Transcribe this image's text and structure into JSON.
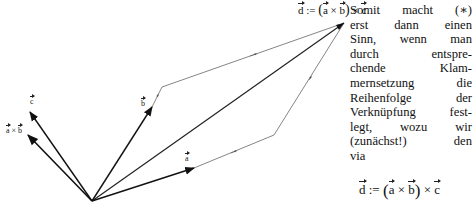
{
  "figure": {
    "origin": [
      92,
      201
    ],
    "vectors": [
      {
        "name": "a",
        "label": "a",
        "tip": [
          194,
          168
        ],
        "end": [
          274,
          135
        ]
      },
      {
        "name": "b",
        "label": "b",
        "tip": [
          152,
          107
        ],
        "end": [
          162,
          87
        ]
      },
      {
        "name": "c",
        "label": "c",
        "tip": [
          30,
          112
        ]
      },
      {
        "name": "a_cross_b",
        "label": "a × b",
        "tip": [
          28,
          135
        ]
      },
      {
        "name": "d",
        "label": "d",
        "tip": [
          344,
          23
        ]
      }
    ],
    "labels": {
      "c": "c",
      "a_cross_b_left": "a",
      "a_cross_b_op": " × ",
      "a_cross_b_right": "b",
      "b": "b",
      "a": "a"
    }
  },
  "header_formula": {
    "lhs": "d",
    "assign": " := ",
    "open": "(",
    "a": "a",
    "times1": " × ",
    "b": "b",
    "close": ")",
    "times2": " × ",
    "c": "c"
  },
  "paragraph": {
    "lines": [
      "Somit macht (∗)",
      "erst dann einen",
      "Sinn, wenn man",
      "durch entspre-",
      "chende Klam-",
      "mernsetzung die",
      "Reihenfolge der",
      "Verknüpfung fest-",
      "legt, wozu wir",
      "(zunächst!) den",
      "via"
    ]
  },
  "display_formula": {
    "lhs": "d",
    "assign": " := ",
    "open": "(",
    "a": "a",
    "times1": " × ",
    "b": "b",
    "close": ")",
    "times2": " × ",
    "c": "c"
  }
}
